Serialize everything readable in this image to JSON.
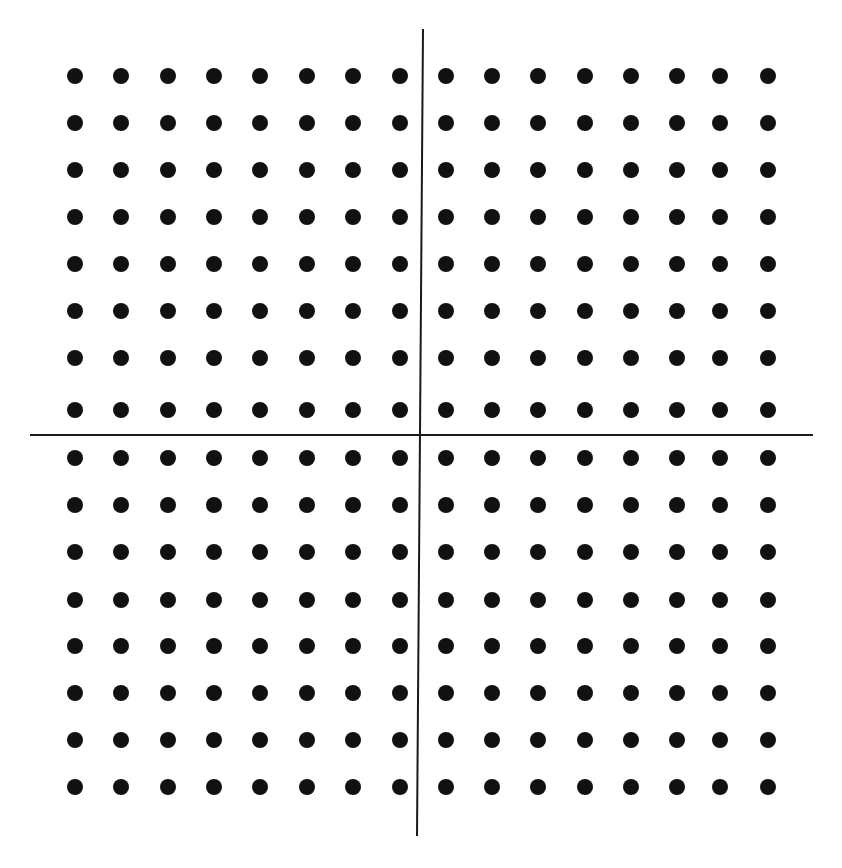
{
  "diagram": {
    "type": "dot-grid-with-axes",
    "grid": {
      "columns": 16,
      "rows": 16,
      "dot_diameter": 16,
      "dot_color": "#111111",
      "x_centers": [
        75,
        121,
        168,
        214,
        260,
        307,
        353,
        400,
        446,
        492,
        538,
        585,
        631,
        677,
        720,
        768
      ],
      "y_centers": [
        76,
        123,
        170,
        217,
        264,
        311,
        358,
        410,
        458,
        505,
        552,
        600,
        646,
        693,
        740,
        787
      ]
    },
    "axes": {
      "vertical": {
        "x_top": 423,
        "y_top": 29,
        "x_bottom": 417,
        "y_bottom": 836
      },
      "horizontal": {
        "x_left": 30,
        "x_right": 813,
        "y": 435
      },
      "color": "#1a1a1a"
    },
    "background": "#ffffff"
  }
}
